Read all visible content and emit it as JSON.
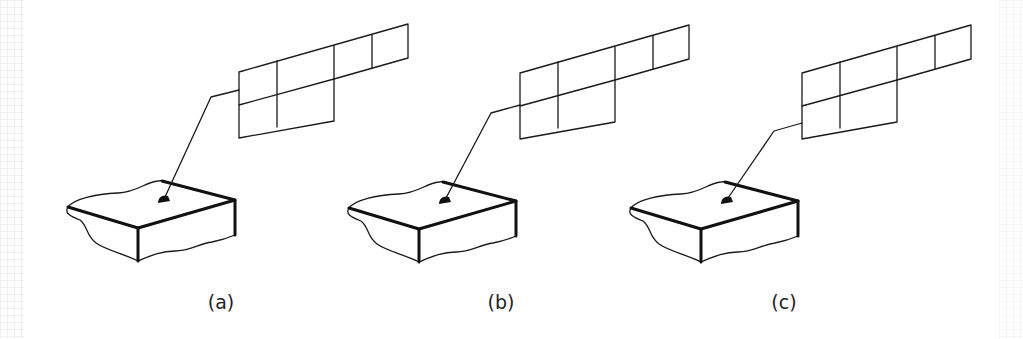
{
  "figure": {
    "type": "technical-diagram",
    "panel_offset_x": 282,
    "panels": [
      {
        "id": "a",
        "label": "(a)",
        "offset_x": 0,
        "grid_dy": 0,
        "leader_bend": [
          211,
          97
        ]
      },
      {
        "id": "b",
        "label": "(b)",
        "offset_x": 281,
        "grid_dy": 1,
        "leader_bend": [
          210,
          113
        ]
      },
      {
        "id": "c",
        "label": "(c)",
        "offset_x": 563,
        "grid_dy": 1,
        "leader_bend": [
          211,
          131
        ]
      }
    ]
  },
  "colors": {
    "line": "#1a1a1a",
    "background": "#ffffff",
    "edge_grid": "#ececec"
  }
}
